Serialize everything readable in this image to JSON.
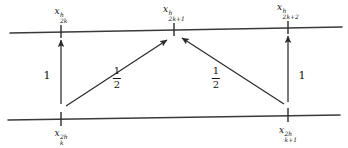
{
  "figure": {
    "background_color": "#ffffff",
    "stroke_color": "#2b2b2b",
    "text_color": "#111111"
  },
  "grids": {
    "fine_line": {
      "name": "fine-grid-line",
      "x1": 10,
      "y1": 33,
      "x2": 342,
      "y2": 27
    },
    "coarse_line": {
      "name": "coarse-grid-line",
      "x1": 8,
      "y1": 120,
      "x2": 340,
      "y2": 115
    }
  },
  "fine_nodes": [
    {
      "id": "fine-node-2k",
      "var": "x",
      "sup": "h",
      "sub": "2k",
      "tick_x": 61,
      "tick_y": 31,
      "label_x": 61,
      "label_y": 8
    },
    {
      "id": "fine-node-2k1",
      "var": "x",
      "sup": "h",
      "sub": "2k+1",
      "tick_x": 174,
      "tick_y": 29,
      "label_x": 174,
      "label_y": 6
    },
    {
      "id": "fine-node-2k2",
      "var": "x",
      "sup": "h",
      "sub": "2k+2",
      "tick_x": 288,
      "tick_y": 27,
      "label_x": 288,
      "label_y": 4
    }
  ],
  "coarse_nodes": [
    {
      "id": "coarse-node-k",
      "var": "x",
      "sup": "2h",
      "sub": "k",
      "tick_x": 61,
      "tick_y": 119,
      "label_x": 61,
      "label_y": 130
    },
    {
      "id": "coarse-node-k1",
      "var": "x",
      "sup": "2h",
      "sub": "k+1",
      "tick_x": 288,
      "tick_y": 115,
      "label_x": 288,
      "label_y": 127
    }
  ],
  "arrows": [
    {
      "id": "arrow-left-vertical",
      "from": "coarse-node-k",
      "to": "fine-node-2k",
      "x1": 61,
      "y1": 104,
      "x2": 61,
      "y2": 38
    },
    {
      "id": "arrow-left-diagonal",
      "from": "coarse-node-k",
      "to": "fine-node-2k1",
      "x1": 66,
      "y1": 106,
      "x2": 166,
      "y2": 38
    },
    {
      "id": "arrow-right-diagonal",
      "from": "coarse-node-k1",
      "to": "fine-node-2k1",
      "x1": 284,
      "y1": 104,
      "x2": 182,
      "y2": 37
    },
    {
      "id": "arrow-right-vertical",
      "from": "coarse-node-k1",
      "to": "fine-node-2k2",
      "x1": 288,
      "y1": 102,
      "x2": 288,
      "y2": 34
    }
  ],
  "weights": [
    {
      "id": "weight-left-one",
      "kind": "integer",
      "value": "1",
      "x": 47,
      "y": 75
    },
    {
      "id": "weight-left-half",
      "kind": "fraction",
      "numerator": "1",
      "denominator": "2",
      "x": 117,
      "y": 78
    },
    {
      "id": "weight-right-half",
      "kind": "fraction",
      "numerator": "1",
      "denominator": "2",
      "x": 216,
      "y": 78
    },
    {
      "id": "weight-right-one",
      "kind": "integer",
      "value": "1",
      "x": 302,
      "y": 75
    }
  ]
}
